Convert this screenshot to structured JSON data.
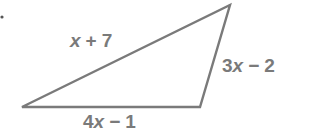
{
  "figure": {
    "type": "triangle",
    "stroke_color": "#7a7a7a",
    "text_color": "#7a7a7a",
    "vertices": {
      "bottom_left": [
        22,
        107
      ],
      "bottom_right": [
        200,
        107
      ],
      "top_right": [
        230,
        5
      ]
    },
    "marker_dot": [
      2,
      17
    ],
    "sides": {
      "hypotenuse": {
        "coef": "",
        "var": "x",
        "op": "+",
        "const": "7"
      },
      "right": {
        "coef": "3",
        "var": "x",
        "op": "−",
        "const": "2"
      },
      "base": {
        "coef": "4",
        "var": "x",
        "op": "−",
        "const": "1"
      }
    }
  }
}
